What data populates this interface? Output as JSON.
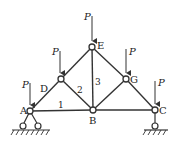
{
  "diagram": {
    "type": "truss",
    "nodes": {
      "A": {
        "label": "A",
        "x": 30,
        "y": 111
      },
      "B": {
        "label": "B",
        "x": 93,
        "y": 110
      },
      "C": {
        "label": "C",
        "x": 155,
        "y": 110
      },
      "D": {
        "label": "D",
        "x": 61,
        "y": 79
      },
      "E": {
        "label": "E",
        "x": 92,
        "y": 47
      },
      "G": {
        "label": "G",
        "x": 126,
        "y": 79
      }
    },
    "members": [
      {
        "from": "A",
        "to": "B",
        "label": "1"
      },
      {
        "from": "D",
        "to": "B",
        "label": "2"
      },
      {
        "from": "E",
        "to": "B",
        "label": "3"
      },
      {
        "from": "B",
        "to": "C",
        "label": ""
      },
      {
        "from": "A",
        "to": "D",
        "label": ""
      },
      {
        "from": "D",
        "to": "E",
        "label": ""
      },
      {
        "from": "E",
        "to": "G",
        "label": ""
      },
      {
        "from": "G",
        "to": "C",
        "label": ""
      },
      {
        "from": "G",
        "to": "B",
        "label": ""
      }
    ],
    "member_labels": {
      "m1": "1",
      "m2": "2",
      "m3": "3"
    },
    "loads": [
      {
        "node": "A",
        "label": "P"
      },
      {
        "node": "D",
        "label": "P"
      },
      {
        "node": "E",
        "label": "P"
      },
      {
        "node": "G",
        "label": "P"
      },
      {
        "node": "C",
        "label": "P"
      }
    ],
    "supports": {
      "A": {
        "type": "pin",
        "label": "pinned support"
      },
      "C": {
        "type": "roller",
        "label": "roller support"
      }
    },
    "colors": {
      "line": "#333333",
      "background": "#ffffff"
    }
  }
}
